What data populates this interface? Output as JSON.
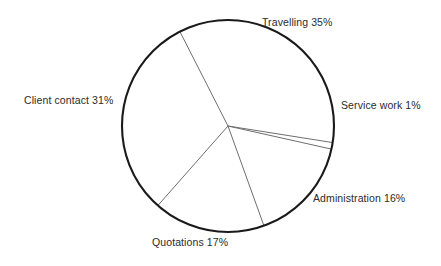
{
  "chart_data": {
    "type": "pie",
    "title": "",
    "subtitle": "",
    "xlabel": "",
    "ylabel": "",
    "grid": false,
    "legend_position": "outside-labels",
    "units": "percent",
    "center": {
      "x": 228,
      "y": 126
    },
    "radius": 106,
    "start_angle_deg": -27,
    "direction": "clockwise",
    "categories": [
      "Travelling",
      "Service work",
      "Administration",
      "Quotations",
      "Client contact"
    ],
    "values": [
      35,
      1,
      16,
      17,
      31
    ],
    "labels": [
      "Travelling 35%",
      "Service work 1%",
      "Administration 16%",
      "Quotations 17%",
      "Client contact 31%"
    ],
    "slices": [
      {
        "name": "Travelling",
        "value": 35,
        "label": "Travelling 35%",
        "start_deg": -27.0,
        "end_deg": 99.0,
        "fill": "#ffffff"
      },
      {
        "name": "Service work",
        "value": 1,
        "label": "Service work 1%",
        "start_deg": 99.0,
        "end_deg": 102.6,
        "fill": "#ffffff"
      },
      {
        "name": "Administration",
        "value": 16,
        "label": "Administration 16%",
        "start_deg": 102.6,
        "end_deg": 160.2,
        "fill": "#ffffff"
      },
      {
        "name": "Quotations",
        "value": 17,
        "label": "Quotations 17%",
        "start_deg": 160.2,
        "end_deg": 221.4,
        "fill": "#ffffff"
      },
      {
        "name": "Client contact",
        "value": 31,
        "label": "Client contact 31%",
        "start_deg": 221.4,
        "end_deg": 333.0,
        "fill": "#ffffff"
      }
    ],
    "colors": {
      "outline": "#1a1a1a",
      "divider": "#6e6e6e",
      "slice_fill": "#ffffff",
      "label_text": "#2b2b2b",
      "background": "#ffffff"
    }
  }
}
